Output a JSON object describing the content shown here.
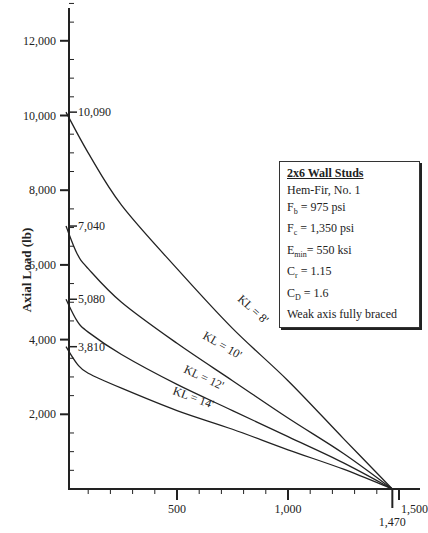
{
  "chart_data": {
    "type": "line",
    "title": "",
    "xlabel": "",
    "ylabel": "Axial Load (lb)",
    "xlim": [
      0,
      1550
    ],
    "ylim": [
      0,
      13000
    ],
    "grid": false,
    "y_ticks": [
      "2,000",
      "4,000",
      "6,000",
      "8,000",
      "10,000",
      "12,000"
    ],
    "x_ticks": [
      "500",
      "1,000",
      "1,500"
    ],
    "x_special_tick": "1,470",
    "series": [
      {
        "name": "KL = 8'",
        "start_label": "10,090",
        "x": [
          0,
          100,
          250,
          500,
          750,
          1000,
          1250,
          1470
        ],
        "y": [
          10090,
          9000,
          7600,
          5900,
          4300,
          2900,
          1350,
          0
        ]
      },
      {
        "name": "KL = 10'",
        "start_label": "7,040",
        "x": [
          0,
          50,
          100,
          250,
          500,
          750,
          1000,
          1250,
          1470
        ],
        "y": [
          7040,
          6300,
          5900,
          5000,
          3900,
          2900,
          1900,
          950,
          0
        ]
      },
      {
        "name": "KL = 12'",
        "start_label": "5,080",
        "x": [
          0,
          50,
          100,
          250,
          500,
          750,
          1000,
          1250,
          1470
        ],
        "y": [
          5080,
          4500,
          4200,
          3600,
          2800,
          2100,
          1400,
          700,
          0
        ]
      },
      {
        "name": "KL = 14'",
        "start_label": "3,810",
        "x": [
          0,
          50,
          100,
          250,
          500,
          750,
          1000,
          1250,
          1470
        ],
        "y": [
          3810,
          3350,
          3100,
          2700,
          2100,
          1600,
          1050,
          530,
          0
        ]
      }
    ],
    "legend": {
      "title": "2x6 Wall Studs",
      "lines": [
        "Hem-Fir, No. 1",
        "Fb = 975 psi",
        "Fc = 1,350 psi",
        "Emin= 550 ksi",
        "Cr = 1.15",
        "CD = 1.6",
        "Weak axis fully braced"
      ]
    }
  },
  "legend_box": {
    "title": "2x6 Wall Studs",
    "species": "Hem-Fir, No. 1",
    "fb": {
      "sym": "F",
      "sub": "b",
      "rest": " = 975 psi"
    },
    "fc": {
      "sym": "F",
      "sub": "c",
      "rest": " = 1,350 psi"
    },
    "emin": {
      "sym": "E",
      "sub": "min",
      "rest": "= 550 ksi"
    },
    "cr": {
      "sym": "C",
      "sub": "r",
      "rest": " = 1.15"
    },
    "cd": {
      "sym": "C",
      "sub": "D",
      "rest": " = 1.6"
    },
    "note": "Weak axis fully braced"
  }
}
